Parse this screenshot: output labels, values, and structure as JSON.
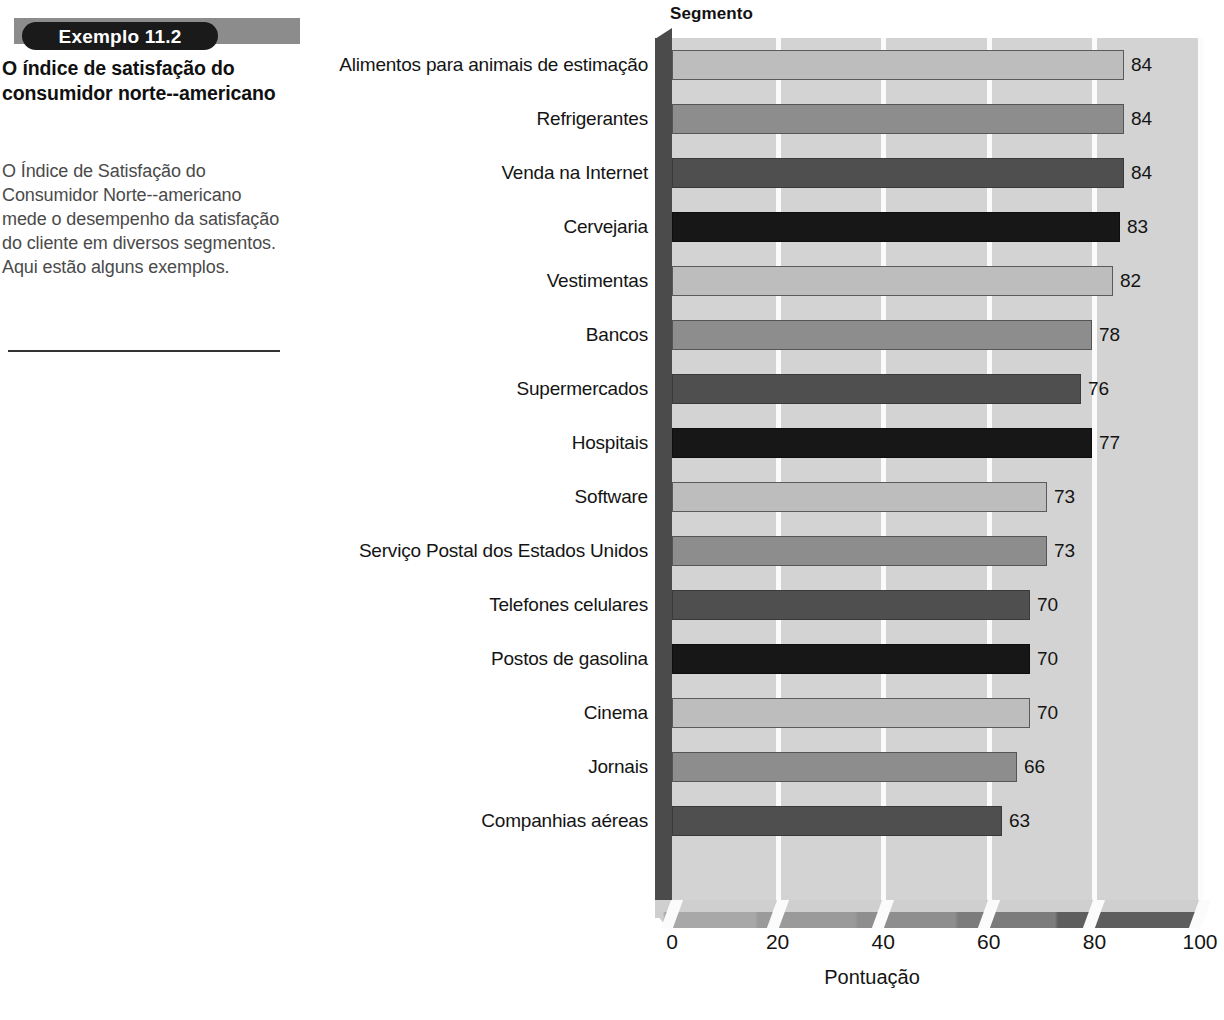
{
  "callout": {
    "badge_label": "Exemplo 11.2",
    "title": "O índice de satisfação do consumidor norte--americano",
    "body": "O Índice de Satisfação do Consumidor Norte--americano mede o desempenho da satisfação do cliente em diversos segmentos. Aqui estão alguns exemplos."
  },
  "chart_data": {
    "type": "bar",
    "orientation": "horizontal",
    "title": "Segmento",
    "xlabel": "Pontuação",
    "ylabel": "Segmento",
    "xlim": [
      0,
      100
    ],
    "xticks": [
      0,
      20,
      40,
      60,
      80,
      100
    ],
    "xtick_labels": [
      "0",
      "20",
      "40",
      "60",
      "80",
      "100"
    ],
    "grid": "vertical",
    "legend": "none",
    "style_3d": true,
    "categories": [
      "Alimentos para animais de estimação",
      "Refrigerantes",
      "Venda na Internet",
      "Cervejaria",
      "Vestimentas",
      "Bancos",
      "Supermercados",
      "Hospitais",
      "Software",
      "Serviço Postal dos Estados Unidos",
      "Telefones celulares",
      "Postos de gasolina",
      "Cinema",
      "Jornais",
      "Companhias aéreas"
    ],
    "values": [
      84,
      84,
      84,
      83,
      82,
      78,
      76,
      77,
      73,
      73,
      70,
      70,
      70,
      66,
      63
    ],
    "value_labels": [
      "84",
      "84",
      "84",
      "83",
      "82",
      "78",
      "76",
      "77",
      "73",
      "73",
      "70",
      "70",
      "70",
      "66",
      "63"
    ],
    "bar_color_index": [
      0,
      1,
      2,
      3,
      0,
      1,
      2,
      3,
      0,
      1,
      2,
      3,
      0,
      1,
      2
    ],
    "palette": [
      "#bdbdbd",
      "#8d8d8d",
      "#4f4f4f",
      "#171717"
    ],
    "plot_bg": "#d3d3d3",
    "gridline_color": "#fbfbfb",
    "sidewall_color": "#4b4b4b",
    "bar_pixel_ends": [
      1124,
      1124,
      1124,
      1120,
      1113,
      1092,
      1081,
      1092,
      1047,
      1047,
      1030,
      1030,
      1030,
      1017,
      1002
    ]
  }
}
